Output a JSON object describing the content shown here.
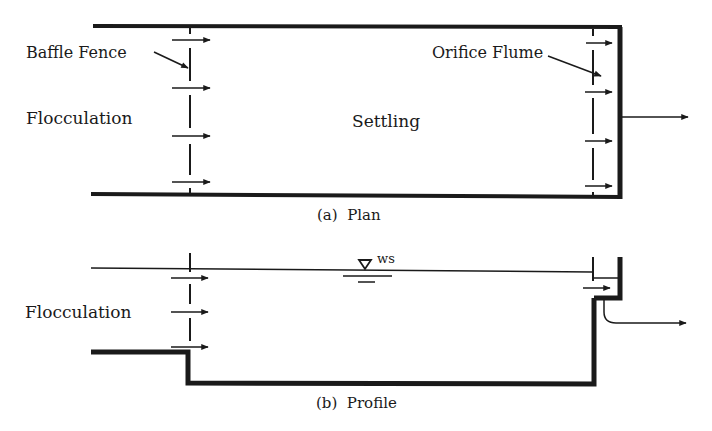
{
  "plan": {
    "caption": "(a)  Plan",
    "labels": {
      "baffle_fence": "Baffle Fence",
      "flocculation": "Flocculation",
      "settling": "Settling",
      "orifice_flume": "Orifice Flume"
    }
  },
  "profile": {
    "caption": "(b)  Profile",
    "labels": {
      "flocculation": "Flocculation",
      "water_surface": "WS"
    }
  },
  "colors": {
    "ink": "#1a1a1a",
    "background": "#ffffff"
  }
}
